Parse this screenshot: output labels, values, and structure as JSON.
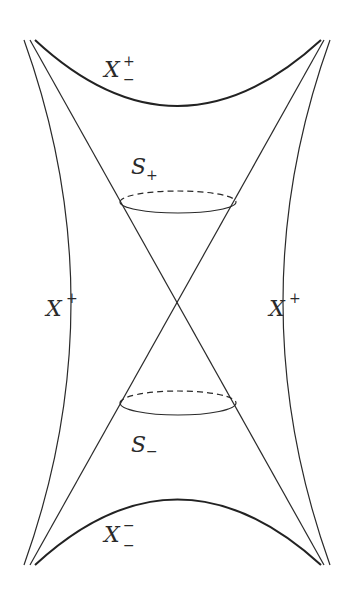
{
  "figure": {
    "colors": {
      "background": "#ffffff",
      "stroke": "#2a2a2a"
    },
    "labels": {
      "top_boundary": {
        "base": "X",
        "sup": "+",
        "sub": "−"
      },
      "bottom_boundary": {
        "base": "X",
        "sup": "−",
        "sub": "−"
      },
      "left_boundary": {
        "base": "X",
        "sup": "+"
      },
      "right_boundary": {
        "base": "X",
        "sup": "+"
      },
      "upper_sphere": {
        "base": "S",
        "sub": "+"
      },
      "lower_sphere": {
        "base": "S",
        "sub": "−"
      }
    }
  }
}
